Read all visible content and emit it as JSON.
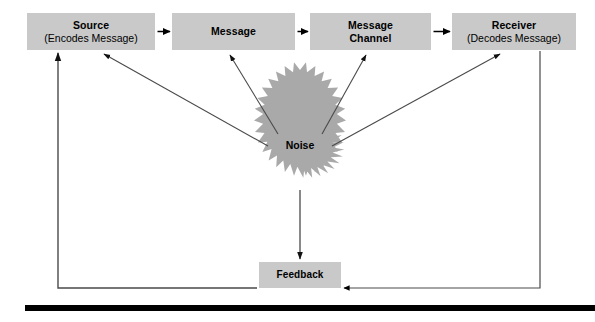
{
  "diagram": {
    "type": "communication-process-model",
    "nodes": [
      {
        "id": "source",
        "title": "Source",
        "subtitle": "(Encodes Message)"
      },
      {
        "id": "message",
        "title": "Message",
        "subtitle": ""
      },
      {
        "id": "channel",
        "title": "Message",
        "subtitle": "Channel"
      },
      {
        "id": "receiver",
        "title": "Receiver",
        "subtitle": "(Decodes Message)"
      },
      {
        "id": "noise",
        "title": "Noise",
        "subtitle": ""
      },
      {
        "id": "feedback",
        "title": "Feedback",
        "subtitle": ""
      }
    ],
    "edges": [
      {
        "from": "source",
        "to": "message",
        "label": ""
      },
      {
        "from": "message",
        "to": "channel",
        "label": ""
      },
      {
        "from": "channel",
        "to": "receiver",
        "label": ""
      },
      {
        "from": "noise",
        "to": "source",
        "label": ""
      },
      {
        "from": "noise",
        "to": "message",
        "label": ""
      },
      {
        "from": "noise",
        "to": "channel",
        "label": ""
      },
      {
        "from": "noise",
        "to": "receiver",
        "label": ""
      },
      {
        "from": "noise",
        "to": "feedback",
        "label": ""
      },
      {
        "from": "receiver",
        "to": "feedback",
        "label": ""
      },
      {
        "from": "feedback",
        "to": "source",
        "label": ""
      }
    ],
    "colors": {
      "box_fill": "#c9c9c9",
      "noise_fill": "#a9a9a9",
      "line": "#4a4a4a",
      "arrow": "#000000",
      "text": "#000000",
      "rule": "#000000",
      "background": "#ffffff"
    }
  }
}
